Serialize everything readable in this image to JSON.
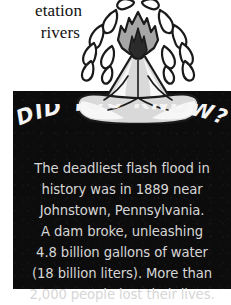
{
  "page": {
    "background_color": "#ffffff",
    "body_text_lines": [
      "etation",
      "rivers"
    ]
  },
  "illustration": {
    "name": "erupting-volcano",
    "description": "Cartoon volcano erupting with a grey plume and white droplets",
    "colors": {
      "outline": "#1a1a1a",
      "mountain_fill": "#d9d9d9",
      "mountain_highlight": "#f7f7f7",
      "plume_fill": "#a6a6a6",
      "plume_core": "#2b2b2b",
      "droplet_fill": "#ffffff"
    }
  },
  "fact_panel": {
    "background_color": "#0d0c0d",
    "headline": "DID YOU KNOW?",
    "headline_color": "#f4f4f4",
    "body_color": "#d6d6d6",
    "body_lines": [
      "The deadliest flash flood in",
      "history was in 1889 near",
      "Johnstown, Pennsylvania.",
      "A dam broke, unleashing",
      "4.8 billion gallons of water",
      "(18 billion liters). More than",
      "2,000 people lost their lives."
    ],
    "body_text": "The deadliest flash flood in history was in 1889 near Johnstown, Pennsylvania. A dam broke, unleashing 4.8 billion gallons of water (18 billion liters). More than 2,000 people lost their lives."
  }
}
